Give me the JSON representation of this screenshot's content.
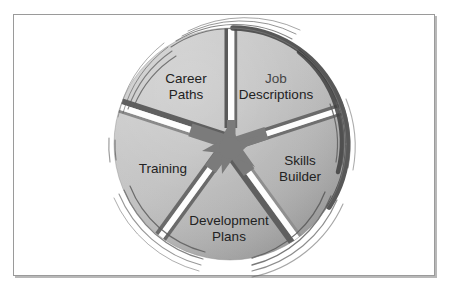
{
  "figure": {
    "type": "wheel-diagram",
    "title": "",
    "segment_count": 5,
    "center": {
      "x": 230,
      "y": 144
    },
    "radius": 116,
    "colors": {
      "page_background": "#ffffff",
      "frame_border": "#9a9a9a",
      "frame_shadow": "#b8b8b8",
      "wheel_light": "#c9c9c9",
      "wheel_mid": "#b5b5b5",
      "wheel_dark": "#9e9e9e",
      "spoke_white": "#fdfdfd",
      "spoke_shadow": "#6f6f6f",
      "hub": "#7b7b7b",
      "arc_dark": "#4a4a4a",
      "arc_thin": "#5c5c5c",
      "label_text": "#222222"
    },
    "segments": [
      {
        "id": "career-paths",
        "label_line1": "Career",
        "label_line2": "Paths",
        "label_x": 186,
        "label_y": 86,
        "mid_angle_deg": -126,
        "faded": false
      },
      {
        "id": "job-descriptions",
        "label_line1": "Job",
        "label_line2": "Descriptions",
        "label_x": 276,
        "label_y": 86,
        "mid_angle_deg": -54,
        "faded": true
      },
      {
        "id": "skills-builder",
        "label_line1": "Skills",
        "label_line2": "Builder",
        "label_x": 300,
        "label_y": 168,
        "mid_angle_deg": 18,
        "faded": false
      },
      {
        "id": "development-plans",
        "label_line1": "Development",
        "label_line2": "Plans",
        "label_x": 229,
        "label_y": 226,
        "mid_angle_deg": 90,
        "faded": false
      },
      {
        "id": "training",
        "label_line1": "Training",
        "label_line2": "",
        "label_x": 163,
        "label_y": 169,
        "mid_angle_deg": 162,
        "faded": false
      }
    ],
    "spokes": [
      {
        "id": "spoke-top",
        "angle_deg": -90
      },
      {
        "id": "spoke-right",
        "angle_deg": -18
      },
      {
        "id": "spoke-bottom-right",
        "angle_deg": 54
      },
      {
        "id": "spoke-bottom-left",
        "angle_deg": 126
      },
      {
        "id": "spoke-left",
        "angle_deg": 198
      }
    ]
  }
}
